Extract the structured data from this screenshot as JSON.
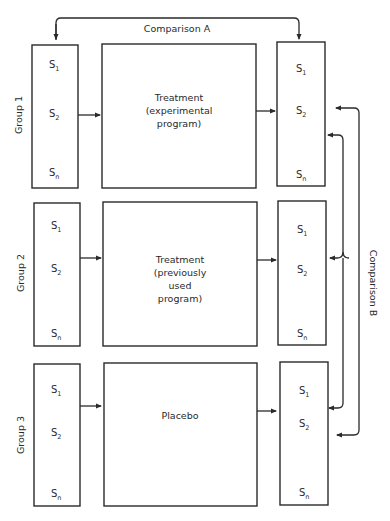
{
  "comparison_a": {
    "label": "Comparison A"
  },
  "comparison_b": {
    "label": "Comparison B"
  },
  "subjects": {
    "s1": "S",
    "s1_sub": "1",
    "s2": "S",
    "s2_sub": "2",
    "sn": "S",
    "sn_sub": "n"
  },
  "groups": [
    {
      "label": "Group 1",
      "treatment_lines": [
        "Treatment",
        "(experimental",
        "program)"
      ]
    },
    {
      "label": "Group 2",
      "treatment_lines": [
        "Treatment",
        "(previously",
        "used",
        "program)"
      ]
    },
    {
      "label": "Group 3",
      "treatment_lines": [
        "Placebo"
      ]
    }
  ],
  "colors": {
    "ink": "#2a2a2a",
    "background": "#ffffff"
  }
}
